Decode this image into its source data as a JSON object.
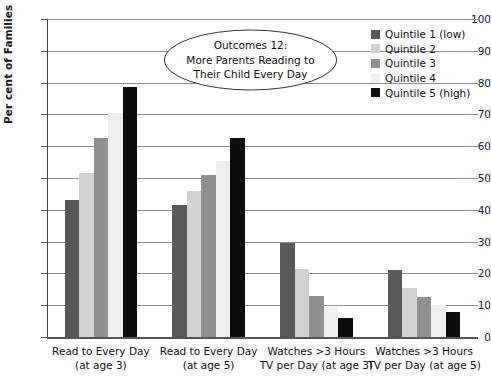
{
  "chart_data": {
    "type": "bar",
    "title": "",
    "xlabel": "",
    "ylabel": "Per cent of Families",
    "ylim": [
      0,
      100
    ],
    "ytick_step": 10,
    "yticks": [
      "100",
      "90",
      "80",
      "70",
      "60",
      "50",
      "40",
      "30",
      "20",
      "10",
      "0"
    ],
    "grid": true,
    "legend_position": "top-right",
    "categories": [
      "Read to Every Day (at age 3)",
      "Read to Every Day (at age 5)",
      "Watches >3 Hours TV per Day (at age 3)",
      "Watches >3 Hours TV per Day (at age 5)"
    ],
    "category_lines": [
      [
        "Read to Every Day",
        "(at age 3)"
      ],
      [
        "Read to Every Day",
        "(at age 5)"
      ],
      [
        "Watches >3 Hours",
        "TV per Day (at age 3)"
      ],
      [
        "Watches >3 Hours",
        "TV per Day (at age 5)"
      ]
    ],
    "series": [
      {
        "name": "Quintile 1 (low)",
        "color": "#595959",
        "values": [
          43,
          41.5,
          29.5,
          21
        ]
      },
      {
        "name": "Quintile 2",
        "color": "#d2d2d2",
        "values": [
          51.5,
          46,
          21.5,
          15.5
        ]
      },
      {
        "name": "Quintile 3",
        "color": "#8f8f8f",
        "values": [
          62.5,
          51,
          13,
          12.5
        ]
      },
      {
        "name": "Quintile 4",
        "color": "#efefef",
        "values": [
          70.5,
          55.5,
          9.5,
          10
        ]
      },
      {
        "name": "Quintile 5 (high)",
        "color": "#0d0d0d",
        "values": [
          78.5,
          62.5,
          6,
          8
        ]
      }
    ],
    "annotation": {
      "shape": "ellipse",
      "lines": [
        "Outcomes 12:",
        "More Parents Reading to",
        "Their Child Every Day"
      ]
    }
  }
}
